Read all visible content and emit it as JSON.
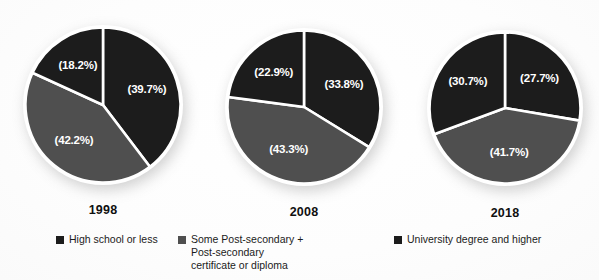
{
  "chart_data": {
    "type": "pie",
    "title": "",
    "categories": [
      "High school or less",
      "Some Post-secondary + Post-secondary certificate or diploma",
      "University degree and higher"
    ],
    "colors": [
      "#1c1c1c",
      "#4f4f4f",
      "#1c1c1c"
    ],
    "legend_position": "bottom",
    "pies": [
      {
        "name": "1998",
        "values": [
          39.7,
          42.2,
          18.2
        ],
        "labels": [
          "(39.7%)",
          "(42.2%)",
          "(18.2%)"
        ]
      },
      {
        "name": "2008",
        "values": [
          33.8,
          43.3,
          22.9
        ],
        "labels": [
          "(33.8%)",
          "(43.3%)",
          "(22.9%)"
        ]
      },
      {
        "name": "2018",
        "values": [
          27.7,
          41.7,
          30.7
        ],
        "labels": [
          "(27.7%)",
          "(41.7%)",
          "(30.7%)"
        ]
      }
    ]
  },
  "legend": {
    "items": [
      {
        "label": "High school or less",
        "color": "#1c1c1c"
      },
      {
        "label": "Some Post-secondary +\nPost-secondary\ncertificate or diploma",
        "color": "#4f4f4f"
      },
      {
        "label": "University degree and higher",
        "color": "#1c1c1c"
      }
    ]
  },
  "layout": {
    "pies": [
      {
        "cx": 103,
        "cy": 105,
        "r": 80,
        "year_top": 203
      },
      {
        "cx": 304,
        "cy": 107,
        "r": 79,
        "year_top": 205
      },
      {
        "cx": 505,
        "cy": 108,
        "r": 78,
        "year_top": 206
      }
    ]
  }
}
